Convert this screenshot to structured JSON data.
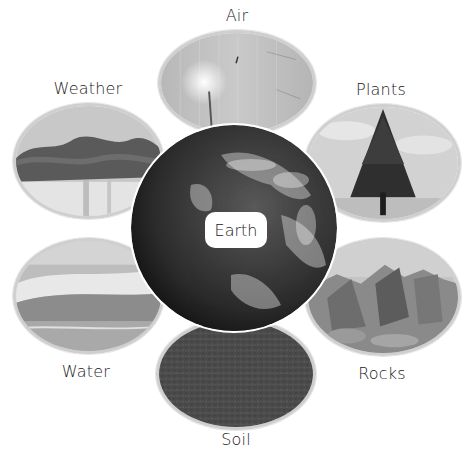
{
  "diagram": {
    "center": {
      "label": "Earth",
      "icon": "globe-icon"
    },
    "items": [
      {
        "id": "air",
        "label": "Air",
        "icon": "dandelion-photo"
      },
      {
        "id": "plants",
        "label": "Plants",
        "icon": "tree-photo"
      },
      {
        "id": "rocks",
        "label": "Rocks",
        "icon": "rocks-photo"
      },
      {
        "id": "soil",
        "label": "Soil",
        "icon": "soil-photo"
      },
      {
        "id": "water",
        "label": "Water",
        "icon": "waves-photo"
      },
      {
        "id": "weather",
        "label": "Weather",
        "icon": "storm-clouds-photo"
      }
    ]
  },
  "colors": {
    "background": "#ffffff",
    "oval_border": "#cfcfcf",
    "text": "#222222"
  }
}
